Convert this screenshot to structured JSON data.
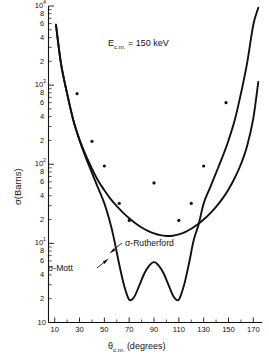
{
  "chart_data": {
    "type": "line",
    "title": "",
    "annotation": "E_c.m. = 150 keV",
    "xlabel": "θ_c.m. (degrees)",
    "ylabel": "σ(Barns)",
    "xscale": "linear",
    "yscale": "log",
    "xlim": [
      5,
      177
    ],
    "ylim": [
      1,
      10000
    ],
    "grid": false,
    "legend_position": "inline-annotations",
    "xticks": [
      10,
      30,
      50,
      70,
      90,
      110,
      130,
      150,
      170
    ],
    "xtick_labels": [
      "10",
      "30",
      "50",
      "70",
      "90",
      "110",
      "130",
      "150",
      "170"
    ],
    "xminor_ticks": [
      20,
      40,
      60,
      80,
      100,
      120,
      140,
      160
    ],
    "ydecades": [
      {
        "value": 1,
        "label": "10",
        "exp": "0"
      },
      {
        "value": 10,
        "label": "10",
        "exp": "1"
      },
      {
        "value": 100,
        "label": "10",
        "exp": "2"
      },
      {
        "value": 1000,
        "label": "10",
        "exp": "3"
      },
      {
        "value": 10000,
        "label": "10",
        "exp": "4"
      }
    ],
    "yminor_labeled": [
      "2",
      "4",
      "6",
      "8"
    ],
    "series": [
      {
        "name": "σ-Rutherford",
        "style": "solid-smooth",
        "x": [
          11,
          15,
          20,
          25,
          30,
          35,
          40,
          45,
          50,
          55,
          60,
          65,
          70,
          75,
          80,
          85,
          90,
          95,
          100,
          105,
          110,
          115,
          120,
          125,
          130,
          135,
          140,
          145,
          150,
          155,
          160,
          165,
          170,
          174
        ],
        "y": [
          5800,
          1900,
          780,
          360,
          205,
          130,
          88,
          62,
          47,
          36.5,
          29.5,
          24.5,
          20.8,
          18.0,
          15.9,
          14.4,
          13.4,
          12.7,
          12.4,
          12.5,
          13.0,
          13.9,
          15.3,
          17.3,
          20.0,
          23.8,
          29.0,
          36.5,
          48.0,
          67.0,
          100.0,
          170.0,
          380.0,
          1100.0
        ]
      },
      {
        "name": "σ-Mott",
        "style": "solid-oscillating",
        "x": [
          11,
          15,
          20,
          25,
          30,
          35,
          40,
          45,
          50,
          55,
          58,
          62,
          66,
          70,
          74,
          78,
          82,
          86,
          90,
          94,
          98,
          102,
          106,
          110,
          114,
          118,
          122,
          126,
          130,
          135,
          140,
          145,
          150,
          155,
          160,
          165,
          170,
          174
        ],
        "y": [
          5800,
          1900,
          780,
          360,
          200,
          122,
          78,
          50,
          32,
          17.5,
          11.0,
          5.4,
          2.9,
          1.95,
          2.1,
          2.9,
          4.1,
          5.2,
          5.8,
          5.2,
          4.1,
          2.9,
          2.1,
          1.95,
          2.9,
          5.4,
          11.0,
          17.5,
          32.0,
          50.0,
          78.0,
          122.0,
          200.0,
          360.0,
          780.0,
          1900.0,
          5800.0,
          9500.0
        ]
      }
    ],
    "data_markers": {
      "note": "small filled dots along curves",
      "points": [
        {
          "x": 28,
          "y": 780
        },
        {
          "x": 40,
          "y": 195
        },
        {
          "x": 50,
          "y": 95
        },
        {
          "x": 62,
          "y": 32
        },
        {
          "x": 70,
          "y": 19.5
        },
        {
          "x": 90,
          "y": 58
        },
        {
          "x": 110,
          "y": 19.5
        },
        {
          "x": 120,
          "y": 32
        },
        {
          "x": 130,
          "y": 95
        },
        {
          "x": 148,
          "y": 600
        }
      ]
    }
  },
  "labels": {
    "energy_annotation": {
      "symbol": "E",
      "subscript": "c.m.",
      "equals": "=",
      "value": "150 keV"
    },
    "rutherford": "σ-Rutherford",
    "mott": "σ-Mott",
    "xaxis_title_symbol": "θ",
    "xaxis_title_sub": "c.m.",
    "xaxis_title_unit": "(degrees)",
    "yaxis_title": "σ(Barns)"
  },
  "yaxis_decade_labels": [
    {
      "mantissa": "10",
      "exp": "4"
    },
    {
      "mantissa": "10",
      "exp": "3"
    },
    {
      "mantissa": "10",
      "exp": "2"
    },
    {
      "mantissa": "10",
      "exp": "1"
    },
    {
      "mantissa": "10",
      "exp": ""
    }
  ],
  "yaxis_minor_labels": [
    "8",
    "6",
    "4",
    "2"
  ],
  "xaxis_labels": [
    "10",
    "30",
    "50",
    "70",
    "90",
    "110",
    "130",
    "150",
    "170"
  ]
}
